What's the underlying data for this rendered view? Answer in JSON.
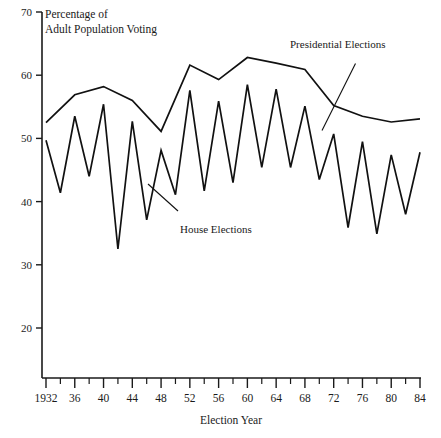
{
  "chart_data": {
    "type": "line",
    "title": "Percentage of Adult Population Voting",
    "title_line1": "Percentage of",
    "title_line2": "Adult Population Voting",
    "xlabel": "Election Year",
    "ylabel": "",
    "xlim": [
      1932,
      1984
    ],
    "ylim": [
      15,
      70
    ],
    "grid": false,
    "legend_position": "inline-annotation",
    "y_ticks": [
      20,
      30,
      40,
      50,
      60,
      70
    ],
    "y_tick_labels": [
      "20",
      "30",
      "40",
      "50",
      "60",
      "70"
    ],
    "x_ticks": [
      1932,
      1936,
      1940,
      1944,
      1948,
      1952,
      1956,
      1960,
      1964,
      1968,
      1972,
      1976,
      1980,
      1984
    ],
    "x_tick_labels": [
      "1932",
      "36",
      "40",
      "44",
      "48",
      "52",
      "56",
      "60",
      "64",
      "68",
      "72",
      "76",
      "80",
      "84"
    ],
    "x_minor_ticks": [
      1934,
      1938,
      1942,
      1946,
      1950,
      1954,
      1958,
      1962,
      1966,
      1970,
      1974,
      1978,
      1982
    ],
    "annotations": [
      {
        "text": "Presidential Elections",
        "x": 1968,
        "y": 65.0
      },
      {
        "text": "House Elections",
        "x": 1948,
        "y": 37.0
      }
    ],
    "series": [
      {
        "name": "Presidential Elections",
        "x": [
          1932,
          1936,
          1940,
          1944,
          1948,
          1952,
          1956,
          1960,
          1964,
          1968,
          1972,
          1976,
          1980,
          1984
        ],
        "values": [
          52.5,
          56.9,
          58.2,
          56.0,
          51.1,
          61.6,
          59.3,
          62.8,
          61.9,
          60.9,
          55.2,
          53.5,
          52.6,
          53.1
        ]
      },
      {
        "name": "House Elections",
        "x": [
          1932,
          1934,
          1936,
          1938,
          1940,
          1942,
          1944,
          1946,
          1948,
          1950,
          1952,
          1954,
          1956,
          1958,
          1960,
          1962,
          1964,
          1966,
          1968,
          1970,
          1972,
          1974,
          1976,
          1978,
          1980,
          1982,
          1984
        ],
        "values": [
          49.7,
          41.4,
          53.5,
          44.0,
          55.4,
          32.5,
          52.7,
          37.1,
          48.1,
          41.1,
          57.6,
          41.7,
          55.9,
          43.0,
          58.5,
          45.4,
          57.8,
          45.4,
          55.1,
          43.5,
          50.7,
          35.9,
          49.5,
          34.9,
          47.4,
          38.0,
          47.8
        ]
      }
    ]
  }
}
